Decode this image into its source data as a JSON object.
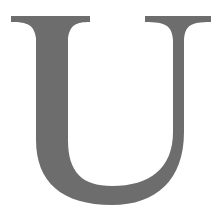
{
  "glyph": {
    "character": "U",
    "style": "serif capital letter",
    "fill_color": "#6d6d6d",
    "background_color": "#ffffff"
  }
}
